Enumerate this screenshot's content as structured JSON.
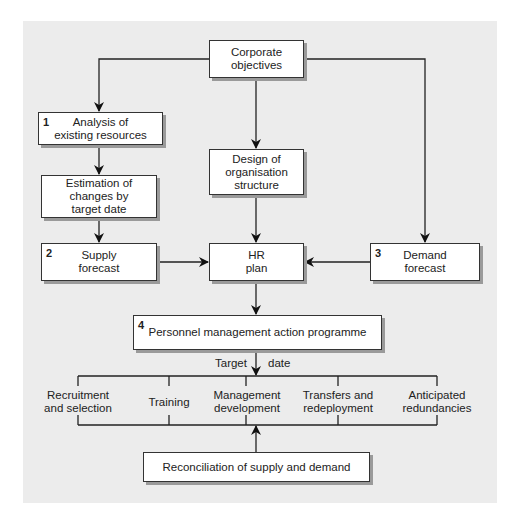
{
  "caption": "Source: Amalgam",
  "boxes": {
    "corporate": {
      "text": "Corporate\nobjectives"
    },
    "analysis": {
      "num": "1",
      "text": "Analysis of\nexisting resources"
    },
    "estimation": {
      "text": "Estimation of\nchanges by\ntarget date"
    },
    "supply": {
      "num": "2",
      "text": "Supply\nforecast"
    },
    "design": {
      "text": "Design of\norganisation\nstructure"
    },
    "hr": {
      "text": "HR\nplan"
    },
    "demand": {
      "num": "3",
      "text": "Demand\nforecast"
    },
    "personnel": {
      "num": "4",
      "text": "Personnel management action programme"
    },
    "reconciliation": {
      "text": "Reconciliation of supply and demand"
    }
  },
  "target": {
    "left": "Target",
    "right": "date"
  },
  "branches": [
    {
      "text": "Recruitment\nand selection"
    },
    {
      "text": "Training"
    },
    {
      "text": "Management\ndevelopment"
    },
    {
      "text": "Transfers and\nredeployment"
    },
    {
      "text": "Anticipated\nredundancies"
    }
  ]
}
